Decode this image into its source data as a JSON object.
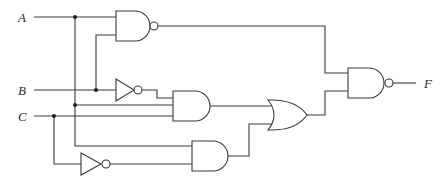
{
  "diagram": {
    "type": "logic-circuit",
    "inputs": [
      {
        "id": "A",
        "label": "A"
      },
      {
        "id": "B",
        "label": "B"
      },
      {
        "id": "C",
        "label": "C"
      }
    ],
    "output": {
      "id": "F",
      "label": "F"
    },
    "gates": [
      {
        "id": "g1",
        "type": "NAND",
        "inputs": [
          "A",
          "B"
        ]
      },
      {
        "id": "g2",
        "type": "NOT",
        "inputs": [
          "B"
        ]
      },
      {
        "id": "g3",
        "type": "AND",
        "inputs": [
          "g2",
          "A",
          "C"
        ]
      },
      {
        "id": "g4",
        "type": "NOT",
        "inputs": [
          "C"
        ]
      },
      {
        "id": "g5",
        "type": "AND",
        "inputs": [
          "A",
          "g4"
        ]
      },
      {
        "id": "g6",
        "type": "OR",
        "inputs": [
          "g3",
          "g5"
        ]
      },
      {
        "id": "g7",
        "type": "NAND",
        "inputs": [
          "g1",
          "g6"
        ],
        "drives": "F"
      }
    ],
    "colors": {
      "line": "#3a3a3a",
      "background": "#ffffff"
    }
  }
}
